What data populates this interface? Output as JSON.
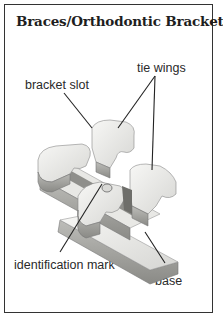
{
  "diagram": {
    "title": "Braces/Orthodontic Bracket",
    "labels": {
      "tie_wings": "tie wings",
      "bracket_slot": "bracket slot",
      "identification_mark": "identification mark",
      "base": "base"
    },
    "colors": {
      "border": "#333333",
      "metal_light": "#f2f2f0",
      "metal_mid": "#c9c9c6",
      "metal_dark": "#7d7d7a",
      "leader_line": "#222222"
    }
  }
}
